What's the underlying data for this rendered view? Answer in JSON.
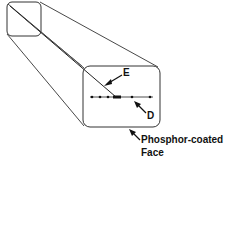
{
  "diagram": {
    "labels": {
      "E": "E",
      "D": "D",
      "face_line1": "Phosphor-coated",
      "face_line2": "Face"
    },
    "colors": {
      "stroke": "#222222",
      "background": "#ffffff"
    }
  }
}
